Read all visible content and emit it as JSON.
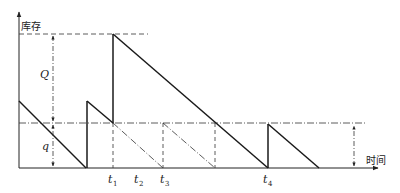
{
  "diagram": {
    "axes": {
      "y_label": "库存",
      "x_label": "时间"
    },
    "dimensions": {
      "order_quantity_label": "Q",
      "reorder_level_label": "q"
    },
    "time_marks": [
      {
        "base": "t",
        "sub": "1"
      },
      {
        "base": "t",
        "sub": "2"
      },
      {
        "base": "t",
        "sub": "3"
      },
      {
        "base": "t",
        "sub": "4"
      }
    ],
    "colors": {
      "line": "#1a1a1a",
      "guide": "#333333",
      "background": "#ffffff"
    }
  }
}
